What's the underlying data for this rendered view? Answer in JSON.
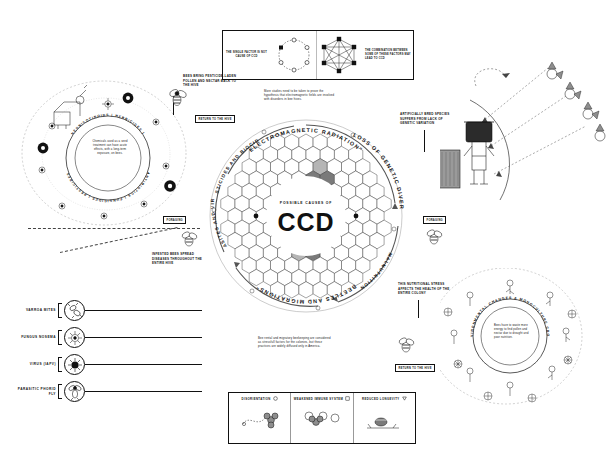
{
  "meta": {
    "title": "Possible Causes of CCD",
    "accent": "#111111",
    "hex_fill_light": "#ffffff",
    "hex_fill_dark": "#7a7a7a",
    "hex_fill_mid": "#b5b5b5"
  },
  "center": {
    "subtitle": "POSSIBLE CAUSES OF",
    "acronym": "CCD"
  },
  "ring_labels": [
    {
      "id": "electromagnetic",
      "text": "ELECTROMAGNETIC RADIATION\""
    },
    {
      "id": "genetic",
      "text": "LOSS OF GENETIC DIVERSITY"
    },
    {
      "id": "malnutrition",
      "text": "MALNUTRITION"
    },
    {
      "id": "beetles",
      "text": "BEETLES AND MIGRATIONS\""
    },
    {
      "id": "parasites",
      "text": "PARASITES AND VIRUS"
    },
    {
      "id": "pesticides",
      "text": "PESTICIDES AND BIOCIDES"
    }
  ],
  "top_panel": {
    "left": {
      "caption": "THE SINGLE FACTOR IS NOT CAUSE OF CCD",
      "diagram": "isolated-nodes-ring"
    },
    "right": {
      "caption": "THE COMBINATION BETWEEN SOME OF THESE FACTORS MAY LEAD TO CCD",
      "diagram": "fully-connected-network"
    }
  },
  "notes": {
    "electromagnetic": "More studies need to be taken to prove the hypothesis that electromagnetic fields are involved with disorders in bee hives.",
    "migratory": "Bee rental and migratory beekeeping are considered as stressfull factors for the colonies, but these practices are widely diffused only in America.",
    "pesticide_return": "BEES BRING PESTICIDE-LADEN POLLEN AND NECTAR BACK TO THE HIVE",
    "infested": "INFESTED BEES SPREAD DISEASES THROUGHOUT THE ENTIRE HIVE",
    "genetic_variation": "ARTIFICIALLY BRED SPECIES SUFFERS FROM LACK OF GENETIC VARIATION",
    "nutritional_stress": "THIS NUTRITIONAL STRESS AFFECTS THE HEALTH OF THE ENTIRE COLONY"
  },
  "badges": {
    "return_hive_top": "RETURN TO THE HIVE",
    "return_hive_bottom": "RETURN TO THE HIVE",
    "foraging_left": "FORAGING",
    "foraging_right": "FORAGING"
  },
  "chem_circle": {
    "ring_text": "PESTICIDES | FUNGICIDES | ANTIBIOTICS | HERBICIDES | NEONICOTINOIDS",
    "body": "Chemicals used as a seed treatment can have acute effects, with a long-term exposure, on bees."
  },
  "env_circle": {
    "ring_text": "ENVIRONMENTAL CHANGES & MONOCULTURE CROPS",
    "body": "Bees have to waste more energy to find pollen and nectar due to drought and poor nutrition."
  },
  "parasite_list": [
    {
      "label": "VARROA MITES",
      "icon": "mite-icon"
    },
    {
      "label": "FUNGUS NOSEMA",
      "icon": "fungus-icon"
    },
    {
      "label": "VIRUS (IAPV)",
      "icon": "virus-icon"
    },
    {
      "label": "PARASITIC PHORID FLY",
      "icon": "fly-icon"
    }
  ],
  "legend": [
    {
      "label": "DISORIENTATION",
      "marker": "circle",
      "icon": "disoriented-bee-icon"
    },
    {
      "label": "WEAKENED IMMUNE SYSTEM",
      "marker": "square",
      "icon": "weak-bee-icon"
    },
    {
      "label": "REDUCED LONGEVITY",
      "marker": "triangle",
      "icon": "dead-bee-icon"
    }
  ]
}
